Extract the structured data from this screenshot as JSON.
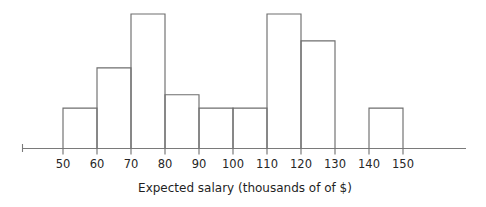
{
  "chart_data": {
    "type": "bar",
    "title": "",
    "subtitle": "",
    "xlabel": "Expected salary (thousands of of $)",
    "ylabel": "",
    "bin_width": 10,
    "bin_edges": [
      50,
      60,
      70,
      80,
      90,
      100,
      110,
      120,
      130,
      140,
      150
    ],
    "categories": [
      "50-60",
      "60-70",
      "70-80",
      "80-90",
      "90-100",
      "100-110",
      "110-120",
      "120-130",
      "130-140",
      "140-150"
    ],
    "values": [
      3,
      6,
      10,
      4,
      3,
      3,
      10,
      8,
      0,
      3
    ],
    "xtick_labels": [
      "50",
      "60",
      "70",
      "80",
      "90",
      "100",
      "110",
      "120",
      "130",
      "140",
      "150"
    ],
    "xlim": [
      45,
      162
    ],
    "ylim": [
      0,
      10
    ],
    "grid": false,
    "legend": false,
    "legend_position": "none",
    "annotations": [],
    "style": {
      "bar_fill": "#ffffff",
      "bar_stroke": "#6e6e6e",
      "axis_color": "#7a7a7a",
      "text_color": "#262626",
      "background": "#ffffff"
    }
  },
  "figure": {
    "caption": "",
    "axis_title_text": "Expected salary (thousands of of $)"
  }
}
